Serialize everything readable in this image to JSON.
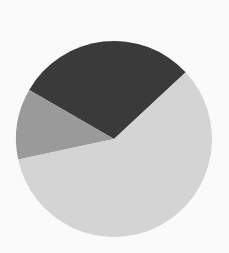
{
  "chart_data": {
    "type": "pie",
    "title": "",
    "labels": [
      "Slice A",
      "Slice B",
      "Slice C"
    ],
    "values": [
      29.7,
      11.7,
      58.6
    ],
    "colors": [
      "#3a3a3a",
      "#9a9a9a",
      "#d4d4d4"
    ],
    "start_angle_deg": 43,
    "direction": "counterclockwise",
    "legend": "none",
    "data_labels": "none"
  },
  "layout": {
    "center_x": 114,
    "center_y": 139,
    "radius": 98,
    "background": "#fafafa"
  }
}
